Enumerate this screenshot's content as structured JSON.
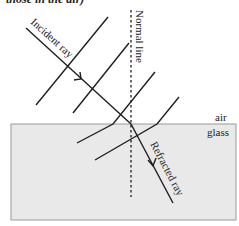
{
  "caption": "those in the air)",
  "labels": {
    "incident_ray": "Incident ray",
    "normal_line": "Normal line",
    "refracted_ray": "Refracted ray",
    "air": "air",
    "glass": "glass"
  },
  "colors": {
    "glass_fill": "#e9e9e9",
    "glass_border": "#9a9a9a",
    "line": "#1e1e1e"
  }
}
